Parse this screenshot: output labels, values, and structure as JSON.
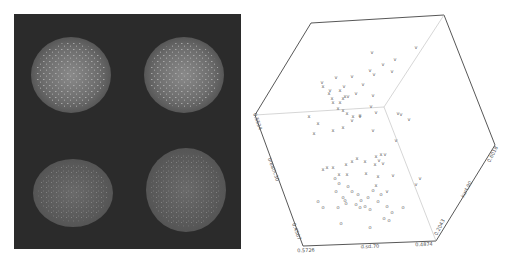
{
  "figure": {
    "left_panel": {
      "type": "microscopy-image",
      "background": "#2b2b2b",
      "objects": [
        {
          "name": "spheroid-top-left",
          "cx": 71,
          "cy": 75,
          "rx": 40,
          "ry": 38,
          "texture": "radial-bright"
        },
        {
          "name": "spheroid-top-right",
          "cx": 184,
          "cy": 75,
          "rx": 40,
          "ry": 38,
          "texture": "speckled-bright"
        },
        {
          "name": "spheroid-bottom-left",
          "cx": 73,
          "cy": 193,
          "rx": 40,
          "ry": 34,
          "texture": "dim-smooth"
        },
        {
          "name": "spheroid-bottom-right",
          "cx": 186,
          "cy": 190,
          "rx": 40,
          "ry": 42,
          "texture": "speckled-dim"
        }
      ]
    }
  },
  "chart_data": {
    "type": "scatter",
    "subtype": "3d-scatter-cube",
    "title": "",
    "axes": {
      "x": {
        "label": "d.sd.70",
        "min": "0.5726",
        "max": "0.4874"
      },
      "y": {
        "label": "kurt.90",
        "min": "0.2043",
        "max": "0.6018"
      },
      "z": {
        "label": "breath.30",
        "min": "0.4507",
        "max": "0.5534"
      }
    },
    "grid": false,
    "legend": null,
    "cube": {
      "vertices": {
        "top_left": [
          311,
          23
        ],
        "top_right": [
          444,
          15
        ],
        "right": [
          495,
          145
        ],
        "bottom_right": [
          436,
          241
        ],
        "bottom_left": [
          303,
          246
        ],
        "left": [
          255,
          115
        ],
        "center": [
          384,
          107
        ]
      }
    },
    "series": [
      {
        "name": "group-v",
        "marker": "v",
        "points": [
          [
            416,
            49
          ],
          [
            395,
            61
          ],
          [
            392,
            73
          ],
          [
            370,
            72
          ],
          [
            352,
            78
          ],
          [
            336,
            79
          ],
          [
            322,
            84
          ],
          [
            374,
            76
          ],
          [
            363,
            86
          ],
          [
            344,
            88
          ],
          [
            330,
            92
          ],
          [
            372,
            54
          ],
          [
            383,
            66
          ],
          [
            356,
            95
          ],
          [
            348,
            98
          ],
          [
            373,
            97
          ],
          [
            371,
            108
          ],
          [
            376,
            114
          ],
          [
            360,
            118
          ],
          [
            352,
            122
          ],
          [
            398,
            115
          ],
          [
            401,
            116
          ],
          [
            409,
            121
          ],
          [
            373,
            132
          ],
          [
            396,
            142
          ],
          [
            385,
            156
          ],
          [
            379,
            162
          ],
          [
            383,
            165
          ],
          [
            393,
            177
          ],
          [
            387,
            193
          ],
          [
            416,
            186
          ],
          [
            420,
            180
          ]
        ]
      },
      {
        "name": "group-x",
        "marker": "x",
        "points": [
          [
            323,
            88
          ],
          [
            329,
            95
          ],
          [
            332,
            100
          ],
          [
            333,
            104
          ],
          [
            340,
            104
          ],
          [
            338,
            110
          ],
          [
            343,
            112
          ],
          [
            347,
            115
          ],
          [
            343,
            100
          ],
          [
            340,
            92
          ],
          [
            345,
            98
          ],
          [
            309,
            118
          ],
          [
            318,
            125
          ],
          [
            314,
            135
          ],
          [
            333,
            132
          ],
          [
            343,
            129
          ],
          [
            353,
            118
          ],
          [
            360,
            117
          ],
          [
            376,
            158
          ],
          [
            381,
            156
          ],
          [
            375,
            166
          ],
          [
            365,
            163
          ],
          [
            352,
            163
          ],
          [
            346,
            166
          ],
          [
            333,
            169
          ],
          [
            327,
            169
          ],
          [
            323,
            171
          ],
          [
            339,
            176
          ],
          [
            347,
            176
          ],
          [
            357,
            160
          ],
          [
            366,
            175
          ],
          [
            378,
            178
          ],
          [
            376,
            187
          ]
        ]
      },
      {
        "name": "group-o",
        "marker": "o",
        "points": [
          [
            335,
            180
          ],
          [
            339,
            185
          ],
          [
            336,
            193
          ],
          [
            348,
            188
          ],
          [
            352,
            193
          ],
          [
            343,
            199
          ],
          [
            358,
            196
          ],
          [
            361,
            202
          ],
          [
            368,
            199
          ],
          [
            373,
            192
          ],
          [
            365,
            208
          ],
          [
            370,
            211
          ],
          [
            378,
            203
          ],
          [
            381,
            196
          ],
          [
            387,
            208
          ],
          [
            392,
            214
          ],
          [
            403,
            209
          ],
          [
            318,
            203
          ],
          [
            323,
            209
          ],
          [
            338,
            209
          ],
          [
            345,
            202
          ],
          [
            346,
            205
          ],
          [
            356,
            206
          ],
          [
            360,
            209
          ],
          [
            384,
            220
          ],
          [
            389,
            222
          ],
          [
            341,
            225
          ],
          [
            370,
            229
          ]
        ]
      }
    ]
  }
}
